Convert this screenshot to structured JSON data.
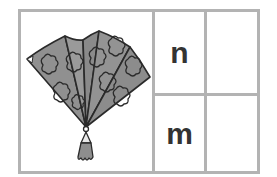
{
  "card": {
    "picture": {
      "subject": "hand fan with tassel",
      "icon": "fan-icon",
      "fill_color": "#8c8c8c",
      "outline_color": "#2a2a2a"
    },
    "rows": [
      {
        "letter": "n",
        "answer": ""
      },
      {
        "letter": "m",
        "answer": ""
      }
    ]
  },
  "colors": {
    "border": "#b3b3b3",
    "letter": "#333333",
    "background": "#ffffff"
  }
}
